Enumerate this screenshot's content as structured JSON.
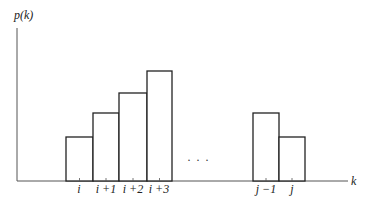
{
  "chart_data": {
    "type": "bar",
    "title": "",
    "ylabel": "p(k)",
    "xlabel": "k",
    "categories": [
      "i",
      "i+1",
      "i+2",
      "i+3",
      "…",
      "j-1",
      "j"
    ],
    "values": [
      44,
      68,
      88,
      110,
      null,
      68,
      44
    ],
    "ylim": [
      0,
      150
    ],
    "grid": false,
    "legend": null,
    "annotations": [
      "…"
    ],
    "bars": [
      {
        "label": "i",
        "x": 66,
        "w": 27,
        "top": 137
      },
      {
        "label": "i+1",
        "x": 93,
        "w": 26,
        "top": 113
      },
      {
        "label": "i+2",
        "x": 119,
        "w": 28,
        "top": 93
      },
      {
        "label": "i+3",
        "x": 147,
        "w": 25,
        "top": 71
      },
      {
        "label": "j-1",
        "x": 253,
        "w": 26,
        "top": 113
      },
      {
        "label": "j",
        "x": 279,
        "w": 26,
        "top": 137
      }
    ]
  },
  "labels": {
    "y_axis": "p(k)",
    "x_axis": "k",
    "ellipsis": "· · ·",
    "ticks": [
      "i",
      "i +1",
      "i +2",
      "i +3",
      "j −1",
      "j"
    ]
  }
}
